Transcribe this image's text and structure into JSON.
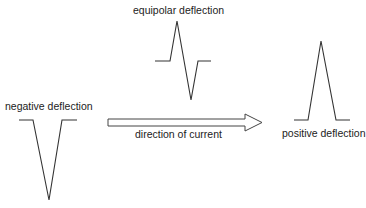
{
  "labels": {
    "equipolar": "equipolar deflection",
    "negative": "negative deflection",
    "positive": "positive deflection",
    "direction": "direction of current"
  },
  "colors": {
    "stroke": "#333333",
    "text": "#222222",
    "background": "#ffffff"
  },
  "waveforms": {
    "equipolar": {
      "points": "155,61 170,61 177,21 191,100 198,61 211,61"
    },
    "negative": {
      "points": "19,120 33,120 49,200 62,120 77,120"
    },
    "positive": {
      "points": "294,120 308,120 321,41 336,120 350,120"
    }
  },
  "arrow": {
    "points": "108,119 245,119 245,114 262,122.5 245,131 245,126 108,126"
  }
}
